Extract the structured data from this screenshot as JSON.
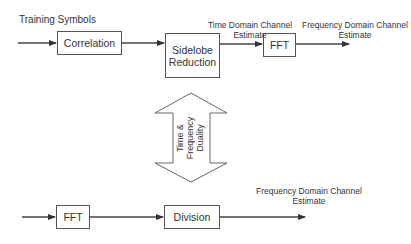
{
  "diagram": {
    "top_row": {
      "input_label": "Training Symbols",
      "blocks": [
        {
          "id": "correlation",
          "label": "Correlation"
        },
        {
          "id": "sidelobe",
          "label_line1": "Sidelobe",
          "label_line2": "Reduction"
        },
        {
          "id": "fft_top",
          "label": "FFT"
        }
      ],
      "time_estimate_label_line1": "Time Domain Channel",
      "time_estimate_label_line2": "Estimate",
      "freq_estimate_label_line1": "Frequency Domain Channel",
      "freq_estimate_label_line2": "Estimate"
    },
    "duality": {
      "line1": "Time &",
      "line2": "Frequency",
      "line3": "Duality"
    },
    "bottom_row": {
      "blocks": [
        {
          "id": "fft_bottom",
          "label": "FFT"
        },
        {
          "id": "division",
          "label": "Division"
        }
      ],
      "freq_estimate_label_line1": "Frequency Domain Channel",
      "freq_estimate_label_line2": "Estimate"
    },
    "colors": {
      "stroke": "#555555",
      "text": "#333333",
      "background": "#ffffff"
    }
  }
}
